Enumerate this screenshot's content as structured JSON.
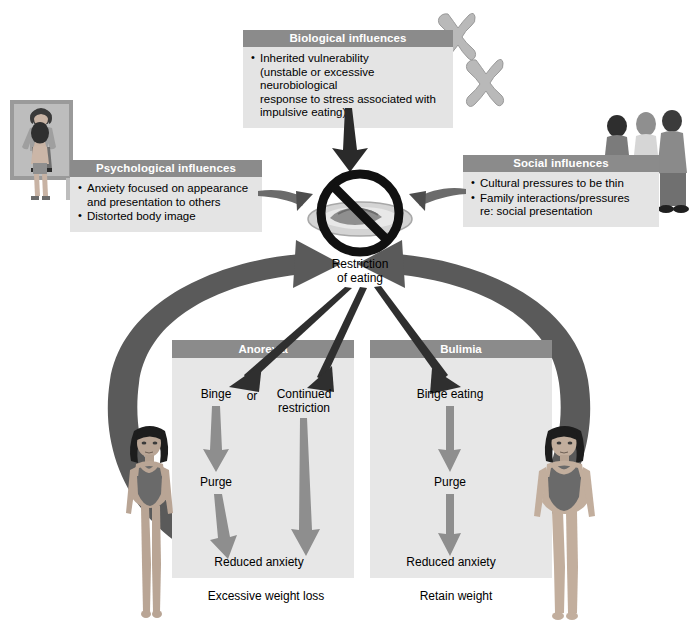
{
  "diagram": {
    "colors": {
      "header_bar": "#8b8b8b",
      "box_body": "#e4e4e4",
      "section_body": "#e7e7e7",
      "dark_arrow": "#4f4f4f",
      "mid_arrow": "#8e8e8e",
      "text": "#000000",
      "header_text": "#ffffff",
      "page_bg": "#ffffff"
    }
  },
  "boxes": {
    "biological": {
      "title": "Biological influences",
      "bullets": [
        {
          "line1": "Inherited vulnerability",
          "line2": "(unstable or excessive neurobiological",
          "line3": "response to stress associated with",
          "line4": "impulsive eating)"
        }
      ]
    },
    "psychological": {
      "title": "Psychological influences",
      "bullets": [
        {
          "line1": "Anxiety focused on appearance",
          "line2": "and presentation to others"
        },
        {
          "line1": "Distorted body image"
        }
      ]
    },
    "social": {
      "title": "Social influences",
      "bullets": [
        {
          "line1": "Cultural pressures to be thin"
        },
        {
          "line1": "Family interactions/pressures",
          "line2": "re: social presentation"
        }
      ]
    }
  },
  "center": {
    "label_line1": "Restriction",
    "label_line2": "of eating",
    "icon": "no-eating-symbol"
  },
  "sections": {
    "anorexia": {
      "title": "Anorexia",
      "nodes": {
        "binge": "Binge",
        "or": "or",
        "continued_restriction_l1": "Continued",
        "continued_restriction_l2": "restriction",
        "purge": "Purge",
        "reduced_anxiety": "Reduced anxiety"
      },
      "caption": "Excessive weight loss",
      "figure": "thin-female-figure"
    },
    "bulimia": {
      "title": "Bulimia",
      "nodes": {
        "binge_eating": "Binge eating",
        "purge": "Purge",
        "reduced_anxiety": "Reduced anxiety"
      },
      "caption": "Retain weight",
      "figure": "average-weight-female-figure"
    }
  },
  "illustrations": {
    "mirror_photo": "woman-looking-in-mirror-distorted-body-image",
    "chromosomes": "chromosome-pair-illustration",
    "group_photo": "group-of-three-people-social-pressure"
  }
}
